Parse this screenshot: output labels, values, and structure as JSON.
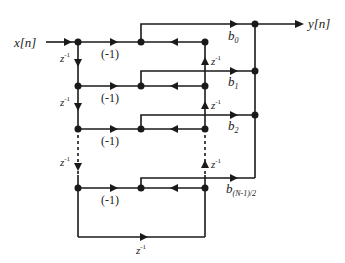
{
  "diagram": {
    "input_label": "x[n]",
    "output_label": "y[n]",
    "delay_label": "z",
    "delay_exponent": "-1",
    "gain_labels": [
      "(-1)",
      "(-1)",
      "(-1)",
      "(-1)"
    ],
    "coefficients": [
      {
        "base": "b",
        "sub": "0"
      },
      {
        "base": "b",
        "sub": "1"
      },
      {
        "base": "b",
        "sub": "2"
      },
      {
        "base": "b",
        "sub": "(N-1)/2"
      }
    ],
    "colors": {
      "line": "#1a1a1a",
      "text": "#222222",
      "background": "#ffffff"
    }
  }
}
